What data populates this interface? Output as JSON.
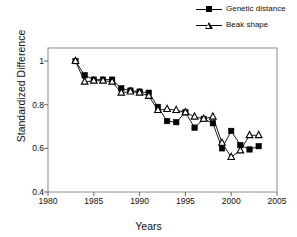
{
  "legend": {
    "position": "top-right",
    "entries": [
      {
        "label": "Genetic distance",
        "marker": "filled-square-icon",
        "color": "#000000"
      },
      {
        "label": "Beak shape",
        "marker": "open-triangle-icon",
        "color": "#000000"
      }
    ]
  },
  "axes": {
    "x": {
      "title": "Years",
      "ticks": [
        "1980",
        "1985",
        "1990",
        "1995",
        "2000",
        "2005"
      ],
      "tick_values": [
        1980,
        1985,
        1990,
        1995,
        2000,
        2005
      ],
      "min": 1980,
      "max": 2005
    },
    "y": {
      "title": "Standardized  Difference",
      "ticks": [
        "0.4",
        "0.6",
        "0.8",
        "1"
      ],
      "tick_values": [
        0.4,
        0.6,
        0.8,
        1.0
      ],
      "min": 0.4,
      "max": 1.06
    }
  },
  "chart_data": {
    "type": "line",
    "title": "",
    "xlabel": "Years",
    "ylabel": "Standardized  Difference",
    "xlim": [
      1980,
      2005
    ],
    "ylim": [
      0.4,
      1.06
    ],
    "grid": false,
    "legend_position": "top-right",
    "x": [
      1983,
      1984,
      1985,
      1986,
      1987,
      1988,
      1989,
      1990,
      1991,
      1992,
      1993,
      1994,
      1995,
      1996,
      1997,
      1998,
      1999,
      2000,
      2001,
      2002,
      2003
    ],
    "series": [
      {
        "name": "Genetic distance",
        "marker": "filled-square",
        "color": "#000000",
        "values": [
          1.0,
          0.935,
          0.915,
          0.915,
          0.915,
          0.875,
          0.865,
          0.86,
          0.855,
          0.79,
          0.725,
          0.72,
          0.765,
          0.695,
          0.735,
          0.715,
          0.6,
          0.68,
          0.615,
          0.595,
          0.61
        ]
      },
      {
        "name": "Beak shape",
        "marker": "open-triangle",
        "color": "#000000",
        "values": [
          1.0,
          0.905,
          0.91,
          0.91,
          0.905,
          0.855,
          0.86,
          0.855,
          0.84,
          0.775,
          0.78,
          0.775,
          0.765,
          0.745,
          0.735,
          0.745,
          0.625,
          0.56,
          0.59,
          0.66,
          0.66
        ]
      }
    ]
  }
}
